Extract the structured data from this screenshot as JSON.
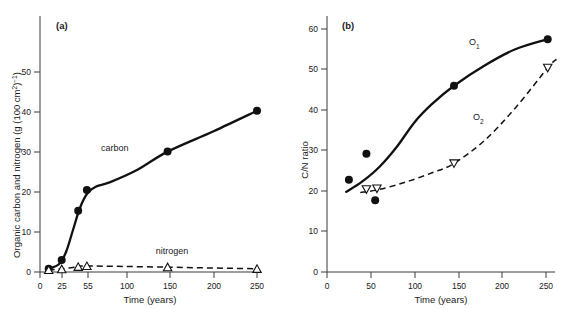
{
  "figure": {
    "background_color": "#ffffff",
    "ink_color": "#111111"
  },
  "panel_a": {
    "label": "(a)",
    "ylabel": "Organic carbon and nitrogen (g (100 cm",
    "ylabel_sup1": "2",
    "ylabel_mid": ")",
    "ylabel_sup2": "−1",
    "ylabel_end": ")",
    "ylabel_full": "Organic carbon and nitrogen (g (100 cm2)−1)",
    "xlabel": "Time (years)",
    "series_label_carbon": "carbon",
    "series_label_nitrogen": "nitrogen",
    "y_ticks": [
      "0",
      "10",
      "20",
      "30",
      "40",
      "50"
    ],
    "x_ticks": [
      "0",
      "25",
      "55",
      "100",
      "150",
      "200",
      "250"
    ]
  },
  "panel_b": {
    "label": "(b)",
    "ylabel": "C/N ratio",
    "xlabel": "Time (years)",
    "series_label_o1": "O",
    "series_label_o1_sub": "1",
    "series_label_o2": "O",
    "series_label_o2_sub": "2",
    "y_ticks": [
      "0",
      "10",
      "20",
      "30",
      "40",
      "50",
      "60"
    ],
    "x_ticks": [
      "0",
      "50",
      "100",
      "150",
      "200",
      "250"
    ]
  },
  "chart_data": [
    {
      "type": "line",
      "panel": "(a)",
      "title": "",
      "xlabel": "Time (years)",
      "ylabel": "Organic carbon and nitrogen (g (100 cm2)-1)",
      "xlim": [
        0,
        260
      ],
      "ylim": [
        0,
        57
      ],
      "x_tick_values": [
        0,
        25,
        55,
        100,
        150,
        200,
        250
      ],
      "y_tick_values": [
        0,
        10,
        20,
        30,
        40,
        50
      ],
      "grid": false,
      "legend": "inline-annotations",
      "series": [
        {
          "name": "carbon",
          "marker": "filled-circle",
          "line": "solid",
          "points": [
            {
              "x": 10,
              "y": 0.8
            },
            {
              "x": 25,
              "y": 3.0
            },
            {
              "x": 44,
              "y": 15.3
            },
            {
              "x": 54,
              "y": 20.5
            },
            {
              "x": 147,
              "y": 30.1
            },
            {
              "x": 250,
              "y": 40.3
            }
          ],
          "curve_points": [
            {
              "x": 10,
              "y": 0.8
            },
            {
              "x": 22,
              "y": 2.0
            },
            {
              "x": 30,
              "y": 5.0
            },
            {
              "x": 38,
              "y": 10.5
            },
            {
              "x": 46,
              "y": 16.0
            },
            {
              "x": 55,
              "y": 19.8
            },
            {
              "x": 65,
              "y": 21.4
            },
            {
              "x": 80,
              "y": 22.4
            },
            {
              "x": 110,
              "y": 25.3
            },
            {
              "x": 147,
              "y": 30.1
            },
            {
              "x": 200,
              "y": 35.2
            },
            {
              "x": 250,
              "y": 40.3
            }
          ]
        },
        {
          "name": "nitrogen",
          "marker": "open-up-triangle",
          "line": "dashed",
          "points": [
            {
              "x": 10,
              "y": 0.5
            },
            {
              "x": 25,
              "y": 0.7
            },
            {
              "x": 44,
              "y": 1.3
            },
            {
              "x": 54,
              "y": 1.5
            },
            {
              "x": 147,
              "y": 1.2
            },
            {
              "x": 250,
              "y": 0.8
            }
          ],
          "curve_points": [
            {
              "x": 10,
              "y": 0.5
            },
            {
              "x": 25,
              "y": 0.8
            },
            {
              "x": 44,
              "y": 1.3
            },
            {
              "x": 54,
              "y": 1.5
            },
            {
              "x": 147,
              "y": 1.2
            },
            {
              "x": 250,
              "y": 0.8
            }
          ]
        }
      ]
    },
    {
      "type": "line",
      "panel": "(b)",
      "title": "",
      "xlabel": "Time (years)",
      "ylabel": "C/N ratio",
      "xlim": [
        0,
        265
      ],
      "ylim": [
        0,
        60
      ],
      "x_tick_values": [
        0,
        50,
        100,
        150,
        200,
        250
      ],
      "y_tick_values": [
        0,
        10,
        20,
        30,
        40,
        50,
        60
      ],
      "grid": false,
      "legend": "inline-annotations",
      "series": [
        {
          "name": "O1",
          "marker": "filled-circle",
          "line": "solid",
          "points": [
            {
              "x": 25,
              "y": 22.8
            },
            {
              "x": 45,
              "y": 29.2
            },
            {
              "x": 55,
              "y": 17.7
            },
            {
              "x": 145,
              "y": 46.0
            },
            {
              "x": 252,
              "y": 57.5
            }
          ],
          "curve_points": [
            {
              "x": 22,
              "y": 19.8
            },
            {
              "x": 40,
              "y": 22.3
            },
            {
              "x": 60,
              "y": 26.0
            },
            {
              "x": 80,
              "y": 31.0
            },
            {
              "x": 100,
              "y": 37.0
            },
            {
              "x": 120,
              "y": 41.5
            },
            {
              "x": 145,
              "y": 46.0
            },
            {
              "x": 180,
              "y": 51.0
            },
            {
              "x": 215,
              "y": 55.0
            },
            {
              "x": 252,
              "y": 57.5
            }
          ]
        },
        {
          "name": "O2",
          "marker": "open-down-triangle",
          "line": "dashed",
          "points": [
            {
              "x": 45,
              "y": 20.4
            },
            {
              "x": 57,
              "y": 20.6
            },
            {
              "x": 145,
              "y": 26.8
            },
            {
              "x": 252,
              "y": 50.4
            }
          ],
          "curve_points": [
            {
              "x": 38,
              "y": 19.6
            },
            {
              "x": 60,
              "y": 20.4
            },
            {
              "x": 90,
              "y": 22.2
            },
            {
              "x": 120,
              "y": 24.5
            },
            {
              "x": 145,
              "y": 26.8
            },
            {
              "x": 180,
              "y": 32.5
            },
            {
              "x": 215,
              "y": 40.5
            },
            {
              "x": 252,
              "y": 50.4
            },
            {
              "x": 262,
              "y": 52.5
            }
          ]
        }
      ]
    }
  ]
}
